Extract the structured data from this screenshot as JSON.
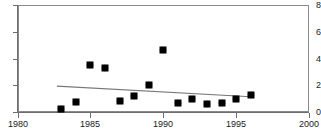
{
  "chart_data": {
    "type": "scatter",
    "title": "",
    "xlabel": "",
    "ylabel": "",
    "xlim": [
      1980,
      2000
    ],
    "ylim": [
      0,
      8
    ],
    "grid": false,
    "legend": "none",
    "xticks": [
      1980,
      1985,
      1990,
      1995,
      2000
    ],
    "xtick_labels": [
      "1980",
      "1985",
      "1990",
      "1995",
      "2000"
    ],
    "yticks": [
      0,
      2,
      4,
      6,
      8
    ],
    "ytick_labels": [
      "0",
      "2",
      "4",
      "6",
      "8"
    ],
    "marker": "diamond",
    "marker_color": "#000000",
    "series": [
      {
        "name": "observations",
        "x": [
          1983,
          1984,
          1985,
          1986,
          1987,
          1988,
          1989,
          1990,
          1991,
          1992,
          1993,
          1994,
          1995,
          1996
        ],
        "values": [
          0.2,
          0.75,
          3.55,
          3.3,
          0.85,
          1.2,
          2.05,
          4.6,
          0.65,
          1.0,
          0.6,
          0.65,
          0.95,
          1.25
        ]
      }
    ],
    "trendline": {
      "name": "linear trend",
      "color": "#777777",
      "x": [
        1982.7,
        1996.0
      ],
      "y": [
        1.93,
        1.14
      ]
    }
  }
}
